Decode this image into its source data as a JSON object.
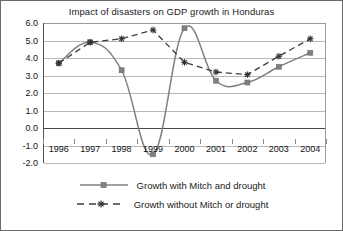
{
  "chart_data": {
    "type": "line",
    "title": "Impact of disasters on GDP growth in Honduras",
    "xlabel": "",
    "ylabel": "",
    "x": [
      "1996",
      "1997",
      "1998",
      "1999",
      "2000",
      "2001",
      "2002",
      "2003",
      "2004"
    ],
    "categories": [
      "1996",
      "1997",
      "1998",
      "1999",
      "2000",
      "2001",
      "2002",
      "2003",
      "2004"
    ],
    "series": [
      {
        "name": "Growth with Mitch and drought",
        "values": [
          3.7,
          4.9,
          3.3,
          -1.5,
          5.7,
          2.7,
          2.6,
          3.5,
          4.3
        ],
        "line_style": "solid",
        "marker": "square",
        "color": "#808080",
        "smoothing": "spline"
      },
      {
        "name": "Growth without Mitch or drought",
        "values": [
          3.7,
          4.9,
          5.1,
          5.6,
          3.75,
          3.2,
          3.05,
          4.1,
          5.1
        ],
        "line_style": "dashed",
        "marker": "star",
        "color": "#3d3d3d",
        "smoothing": "straight"
      }
    ],
    "ylim": [
      -2.0,
      6.0
    ],
    "yticks": [
      6.0,
      5.0,
      4.0,
      3.0,
      2.0,
      1.0,
      0.0,
      -1.0,
      -2.0
    ],
    "ytick_labels": [
      "6.0",
      "5.0",
      "4.0",
      "3.0",
      "2.0",
      "1.0",
      "0.0",
      "-1.0",
      "-2.0"
    ],
    "grid": true,
    "grid_axis": "y",
    "legend_position": "bottom",
    "zero_line": 0.0
  },
  "legend": {
    "items": [
      {
        "label": "Growth with Mitch and drought",
        "marker": "square-marker",
        "style": "solid"
      },
      {
        "label": "Growth without Mitch or drought",
        "marker": "star-marker",
        "style": "dashed"
      }
    ]
  },
  "colors": {
    "series_solid": "#808080",
    "series_dashed": "#3d3d3d",
    "gridline": "#b8b8b8",
    "zero_line": "#4a4a4a",
    "axis": "#555555",
    "text": "#1a1a1a",
    "background": "#ffffff",
    "border": "#6b6b6b"
  }
}
